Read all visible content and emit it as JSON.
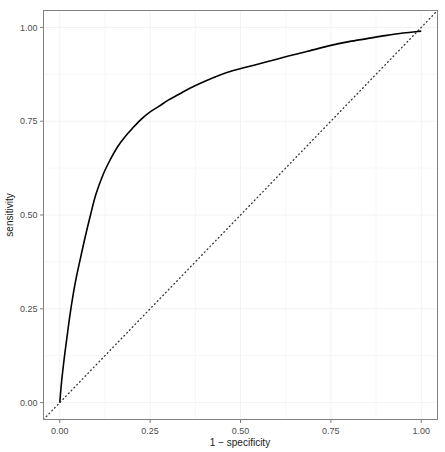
{
  "figure": {
    "kind": "roc-curve-plot",
    "background_color": "#ffffff",
    "panel_background_color": "#ffffff",
    "panel_border_color": "#808080",
    "grid_color": "#f2f2f2",
    "curve_color": "#000000",
    "reference_line_color": "#333333",
    "axis_text_color": "#4d4d4d",
    "axis_title_color": "#1a1a1a"
  },
  "chart_data": {
    "type": "line",
    "title": "",
    "subtitle": "",
    "xlabel": "1 − specificity",
    "ylabel": "sensitivity",
    "xlim": [
      -0.045,
      1.045
    ],
    "ylim": [
      -0.045,
      1.045
    ],
    "grid": true,
    "legend": "none",
    "xticks": [
      0,
      0.25,
      0.5,
      0.75,
      1
    ],
    "xticklabels": [
      "0.00",
      "0.25",
      "0.50",
      "0.75",
      "1.00"
    ],
    "yticks": [
      0,
      0.25,
      0.5,
      0.75,
      1
    ],
    "yticklabels": [
      "0.00",
      "0.25",
      "0.50",
      "0.75",
      "1.00"
    ],
    "series": [
      {
        "name": "ROC curve",
        "style": "solid",
        "color": "#000000",
        "width": 1.6,
        "x": [
          0,
          0.005,
          0.012,
          0.02,
          0.03,
          0.042,
          0.055,
          0.07,
          0.085,
          0.1,
          0.12,
          0.14,
          0.16,
          0.18,
          0.2,
          0.225,
          0.25,
          0.275,
          0.3,
          0.33,
          0.36,
          0.4,
          0.44,
          0.48,
          0.52,
          0.56,
          0.6,
          0.65,
          0.7,
          0.75,
          0.8,
          0.85,
          0.9,
          0.95,
          1
        ],
        "y": [
          0,
          0.055,
          0.115,
          0.175,
          0.245,
          0.315,
          0.375,
          0.44,
          0.5,
          0.555,
          0.608,
          0.648,
          0.682,
          0.708,
          0.73,
          0.755,
          0.775,
          0.79,
          0.806,
          0.822,
          0.838,
          0.856,
          0.872,
          0.885,
          0.895,
          0.905,
          0.915,
          0.928,
          0.94,
          0.952,
          0.962,
          0.97,
          0.978,
          0.985,
          0.99
        ]
      },
      {
        "name": "chance diagonal",
        "style": "dotted",
        "color": "#333333",
        "width": 1.2,
        "x": [
          -0.045,
          1.045
        ],
        "y": [
          -0.045,
          1.045
        ]
      }
    ],
    "annotations": []
  },
  "axes": {
    "x_title": "1 − specificity",
    "y_title": "sensitivity",
    "x_tick_labels": [
      "0.00",
      "0.25",
      "0.50",
      "0.75",
      "1.00"
    ],
    "y_tick_labels": [
      "0.00",
      "0.25",
      "0.50",
      "0.75",
      "1.00"
    ]
  }
}
